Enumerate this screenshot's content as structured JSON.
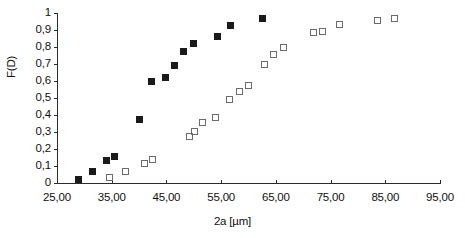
{
  "chart_data": {
    "type": "scatter",
    "title": "",
    "xlabel": "2a  [µm]",
    "ylabel": "F(D)",
    "xlim": [
      25.0,
      95.0
    ],
    "ylim": [
      0.0,
      1.0
    ],
    "grid": false,
    "legend": "none",
    "x_tick_labels": [
      "25,00",
      "35,00",
      "45,00",
      "55,00",
      "65,00",
      "75,00",
      "85,00",
      "95,00"
    ],
    "x_tick_values": [
      25.0,
      35.0,
      45.0,
      55.0,
      65.0,
      75.0,
      85.0,
      95.0
    ],
    "y_tick_labels": [
      "1",
      "0,9",
      "0,8",
      "0,7",
      "0,6",
      "0,5",
      "0,4",
      "0,3",
      "0,2",
      "0,1",
      "0"
    ],
    "y_tick_values": [
      1.0,
      0.9,
      0.8,
      0.7,
      0.6,
      0.5,
      0.4,
      0.3,
      0.2,
      0.1,
      0.0
    ],
    "series": [
      {
        "name": "filled-squares",
        "marker": "filled-square",
        "color": "#1a1a1a",
        "points": [
          [
            29.0,
            0.02
          ],
          [
            31.5,
            0.065
          ],
          [
            34.0,
            0.135
          ],
          [
            35.6,
            0.155
          ],
          [
            40.0,
            0.375
          ],
          [
            42.2,
            0.6
          ],
          [
            44.8,
            0.62
          ],
          [
            46.5,
            0.69
          ],
          [
            48.2,
            0.775
          ],
          [
            50.0,
            0.82
          ],
          [
            54.4,
            0.86
          ],
          [
            56.8,
            0.925
          ],
          [
            62.6,
            0.965
          ]
        ]
      },
      {
        "name": "open-squares",
        "marker": "open-square",
        "color": "#6b6b6b",
        "points": [
          [
            34.6,
            0.03
          ],
          [
            37.6,
            0.065
          ],
          [
            41.0,
            0.115
          ],
          [
            42.4,
            0.14
          ],
          [
            49.2,
            0.275
          ],
          [
            50.1,
            0.305
          ],
          [
            51.6,
            0.355
          ],
          [
            54.0,
            0.385
          ],
          [
            56.6,
            0.49
          ],
          [
            58.4,
            0.54
          ],
          [
            60.0,
            0.575
          ],
          [
            63.0,
            0.7
          ],
          [
            64.6,
            0.755
          ],
          [
            66.4,
            0.8
          ],
          [
            71.8,
            0.885
          ],
          [
            73.6,
            0.89
          ],
          [
            76.6,
            0.93
          ],
          [
            83.6,
            0.955
          ],
          [
            86.6,
            0.97
          ]
        ]
      }
    ]
  }
}
